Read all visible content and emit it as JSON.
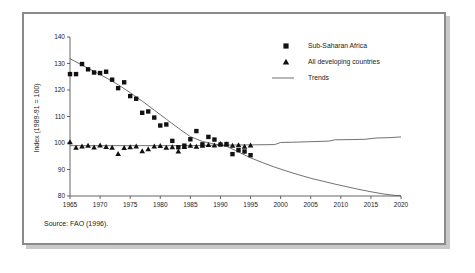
{
  "figure": {
    "source_note": "Source: FAO (1996)."
  },
  "legend": {
    "position": "top-right",
    "entries": [
      {
        "label": "Sub-Saharan Africa",
        "marker": "square-marker-icon"
      },
      {
        "label": "All developing countries",
        "marker": "triangle-marker-icon"
      },
      {
        "label": "Trends",
        "marker": "line-marker-icon"
      }
    ]
  },
  "chart_data": {
    "type": "scatter",
    "title": "",
    "subtitle": "",
    "xlabel": "",
    "ylabel": "Index (1989-91 = 100)",
    "xlim": [
      1965,
      2020
    ],
    "ylim": [
      80,
      140
    ],
    "grid": false,
    "xticks": [
      1965,
      1970,
      1975,
      1980,
      1985,
      1990,
      1995,
      2000,
      2005,
      2010,
      2015,
      2020
    ],
    "yticks": [
      80,
      90,
      100,
      110,
      120,
      130,
      140
    ],
    "series": [
      {
        "name": "Sub-Saharan Africa",
        "marker": "square",
        "x": [
          1965,
          1966,
          1967,
          1968,
          1969,
          1970,
          1971,
          1972,
          1973,
          1974,
          1975,
          1976,
          1977,
          1978,
          1979,
          1980,
          1981,
          1982,
          1983,
          1984,
          1985,
          1986,
          1987,
          1988,
          1989,
          1990,
          1991,
          1992,
          1993,
          1994,
          1995
        ],
        "y": [
          126.0,
          126.0,
          129.8,
          127.8,
          126.6,
          126.4,
          126.9,
          123.9,
          120.7,
          122.9,
          117.7,
          116.7,
          111.4,
          111.9,
          109.6,
          106.6,
          107.0,
          100.8,
          98.4,
          99.0,
          101.4,
          104.5,
          99.5,
          102.3,
          101.3,
          99.4,
          99.6,
          95.8,
          97.3,
          96.8,
          95.4
        ]
      },
      {
        "name": "All developing countries",
        "marker": "triangle",
        "x": [
          1965,
          1966,
          1967,
          1968,
          1969,
          1970,
          1971,
          1972,
          1973,
          1974,
          1975,
          1976,
          1977,
          1978,
          1979,
          1980,
          1981,
          1982,
          1983,
          1984,
          1985,
          1986,
          1987,
          1988,
          1989,
          1990,
          1991,
          1992,
          1993,
          1994,
          1995
        ],
        "y": [
          100.4,
          98.3,
          98.8,
          99.0,
          98.4,
          99.1,
          98.6,
          98.3,
          95.9,
          98.2,
          98.5,
          98.8,
          97.0,
          97.7,
          98.8,
          98.9,
          98.3,
          98.5,
          96.9,
          98.6,
          99.0,
          98.7,
          99.0,
          99.3,
          99.1,
          99.7,
          99.5,
          99.0,
          99.2,
          98.7,
          99.1
        ]
      }
    ],
    "trends": [
      {
        "name": "Sub-Saharan Africa trend",
        "x": [
          1965,
          1967,
          1969,
          1971,
          1973,
          1975,
          1977,
          1979,
          1981,
          1983,
          1985,
          1987,
          1989,
          1991,
          1993,
          1995,
          1997,
          1999,
          2001,
          2003,
          2005,
          2007,
          2009,
          2011,
          2013,
          2015,
          2017,
          2019,
          2020
        ],
        "y": [
          131.8,
          129.4,
          127.0,
          124.6,
          122.0,
          119.0,
          115.8,
          112.4,
          109.0,
          105.6,
          102.4,
          100.6,
          99.6,
          98.8,
          96.6,
          94.4,
          92.6,
          90.9,
          89.4,
          88.0,
          86.7,
          85.6,
          84.5,
          83.5,
          82.5,
          81.6,
          80.8,
          80.2,
          80.1
        ]
      },
      {
        "name": "All developing countries trend",
        "x": [
          1965,
          1970,
          1975,
          1980,
          1985,
          1990,
          1995,
          1999,
          2000,
          2002,
          2005,
          2008,
          2009,
          2012,
          2014,
          2016,
          2018,
          2020
        ],
        "y": [
          99.0,
          99.0,
          99.0,
          99.0,
          99.0,
          99.2,
          99.3,
          99.4,
          100.2,
          100.3,
          100.5,
          100.7,
          101.2,
          101.3,
          101.4,
          101.9,
          102.0,
          102.3
        ]
      }
    ]
  }
}
